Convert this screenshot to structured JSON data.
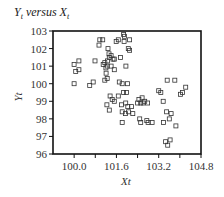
{
  "chart_data": {
    "type": "scatter",
    "title": "Yt versus Xt",
    "title_parts": {
      "y": "Y",
      "y_sub": "t",
      "mid": " versus ",
      "x": "X",
      "x_sub": "t"
    },
    "xlabel": "Xt",
    "ylabel": "Yt",
    "xlim": [
      99.2,
      104.8
    ],
    "ylim": [
      96,
      103
    ],
    "xticks": [
      100.0,
      100.8,
      101.6,
      102.4,
      103.2,
      104.0,
      104.8
    ],
    "xtick_labels": [
      "100.0",
      "101.6",
      "103.2",
      "104.8"
    ],
    "xtick_labeled_values": [
      100.0,
      101.6,
      103.2,
      104.8
    ],
    "yticks": [
      96,
      97,
      98,
      99,
      100,
      101,
      102,
      103
    ],
    "ytick_labels": [
      "96",
      "97",
      "98",
      "99",
      "100",
      "101",
      "102",
      "103"
    ],
    "grid": false,
    "legend": null,
    "marker": "open-square",
    "series": [
      {
        "name": "Yt vs Xt",
        "points": [
          [
            100.0,
            101.1
          ],
          [
            100.06,
            100.7
          ],
          [
            100.18,
            100.8
          ],
          [
            100.18,
            101.3
          ],
          [
            100.0,
            100.0
          ],
          [
            100.59,
            99.9
          ],
          [
            100.72,
            100.1
          ],
          [
            100.94,
            102.2
          ],
          [
            100.97,
            102.5
          ],
          [
            101.08,
            102.5
          ],
          [
            100.79,
            101.3
          ],
          [
            101.1,
            101.1
          ],
          [
            101.16,
            101.2
          ],
          [
            101.2,
            100.9
          ],
          [
            101.25,
            101.0
          ],
          [
            101.26,
            101.3
          ],
          [
            101.33,
            101.5
          ],
          [
            101.4,
            101.0
          ],
          [
            101.52,
            101.4
          ],
          [
            101.52,
            100.8
          ],
          [
            101.59,
            102.4
          ],
          [
            101.67,
            102.5
          ],
          [
            101.75,
            101.5
          ],
          [
            101.87,
            102.8
          ],
          [
            101.9,
            102.7
          ],
          [
            101.89,
            102.4
          ],
          [
            101.28,
            102.0
          ],
          [
            101.32,
            101.7
          ],
          [
            101.4,
            101.6
          ],
          [
            101.47,
            101.4
          ],
          [
            101.21,
            100.6
          ],
          [
            101.25,
            100.3
          ],
          [
            101.16,
            100.2
          ],
          [
            101.36,
            99.3
          ],
          [
            101.44,
            99.1
          ],
          [
            101.52,
            99.0
          ],
          [
            101.24,
            98.8
          ],
          [
            101.33,
            98.5
          ],
          [
            101.67,
            99.3
          ],
          [
            101.71,
            100.1
          ],
          [
            101.82,
            100.0
          ],
          [
            101.87,
            99.5
          ],
          [
            101.79,
            98.8
          ],
          [
            101.82,
            98.4
          ],
          [
            101.94,
            98.3
          ],
          [
            101.95,
            98.9
          ],
          [
            102.03,
            98.7
          ],
          [
            102.06,
            98.4
          ],
          [
            102.17,
            98.7
          ],
          [
            101.82,
            97.8
          ],
          [
            101.98,
            99.5
          ],
          [
            102.02,
            100.0
          ],
          [
            102.22,
            98.3
          ],
          [
            102.4,
            98.9
          ],
          [
            102.45,
            99.1
          ],
          [
            102.52,
            98.9
          ],
          [
            102.57,
            99.2
          ],
          [
            102.61,
            98.9
          ],
          [
            102.67,
            99.0
          ],
          [
            102.78,
            98.9
          ],
          [
            102.48,
            98.0
          ],
          [
            102.52,
            97.8
          ],
          [
            102.75,
            97.9
          ],
          [
            102.8,
            97.8
          ],
          [
            102.95,
            97.8
          ],
          [
            103.2,
            99.6
          ],
          [
            103.28,
            99.5
          ],
          [
            103.37,
            99.0
          ],
          [
            103.52,
            100.2
          ],
          [
            103.5,
            98.4
          ],
          [
            103.6,
            98.0
          ],
          [
            103.67,
            98.3
          ],
          [
            103.81,
            100.2
          ],
          [
            103.85,
            97.6
          ],
          [
            104.02,
            99.4
          ],
          [
            104.1,
            99.5
          ],
          [
            104.22,
            99.8
          ],
          [
            103.38,
            97.8
          ],
          [
            103.46,
            96.7
          ],
          [
            103.54,
            96.5
          ],
          [
            103.63,
            96.8
          ],
          [
            102.05,
            102.0
          ],
          [
            102.1,
            102.5
          ],
          [
            102.1,
            101.9
          ],
          [
            101.96,
            101.0
          ]
        ]
      }
    ],
    "colors": {
      "marker": "#333333",
      "axis": "#111111"
    }
  }
}
